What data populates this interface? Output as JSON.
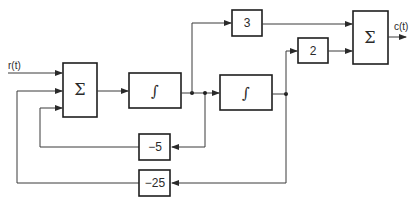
{
  "diagram": {
    "type": "block-diagram",
    "signals": {
      "input": "r(t)",
      "output": "c(t)"
    },
    "blocks": [
      {
        "id": "sum1",
        "label": "Σ",
        "kind": "summing-junction"
      },
      {
        "id": "int1",
        "label": "∫",
        "kind": "integrator"
      },
      {
        "id": "int2",
        "label": "∫",
        "kind": "integrator"
      },
      {
        "id": "gain3",
        "label": "3",
        "kind": "gain"
      },
      {
        "id": "gain2",
        "label": "2",
        "kind": "gain"
      },
      {
        "id": "sum2",
        "label": "Σ",
        "kind": "summing-junction"
      },
      {
        "id": "gain_m5",
        "label": "−5",
        "kind": "gain"
      },
      {
        "id": "gain_m25",
        "label": "−25",
        "kind": "gain"
      }
    ],
    "connections": [
      {
        "from": "r(t)",
        "to": "sum1"
      },
      {
        "from": "sum1",
        "to": "int1"
      },
      {
        "from": "int1",
        "to": "gain3"
      },
      {
        "from": "int1",
        "to": "int2"
      },
      {
        "from": "int1",
        "to": "gain_m5"
      },
      {
        "from": "int2",
        "to": "gain2"
      },
      {
        "from": "int2",
        "to": "gain_m25"
      },
      {
        "from": "gain3",
        "to": "sum2"
      },
      {
        "from": "gain2",
        "to": "sum2"
      },
      {
        "from": "gain_m5",
        "to": "sum1"
      },
      {
        "from": "gain_m25",
        "to": "sum1"
      },
      {
        "from": "sum2",
        "to": "c(t)"
      }
    ]
  }
}
